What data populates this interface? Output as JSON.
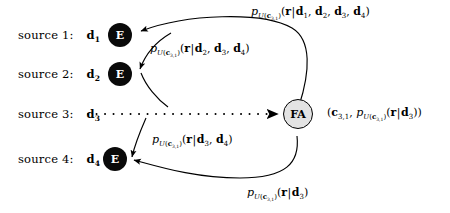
{
  "diagram": {
    "background_color": "#ffffff",
    "node_e_color": "#0a0a0a",
    "node_e_text_color": "#ffffff",
    "node_fa_color": "#e3e3e3",
    "node_fa_border_color": "#000000",
    "edge_color": "#000000"
  },
  "sources": [
    {
      "id": "source-1",
      "label": "source 1:",
      "variable": "d",
      "variable_sub": "1",
      "encoder_label": "E",
      "has_encoder": true,
      "connector": "solid"
    },
    {
      "id": "source-2",
      "label": "source 2:",
      "variable": "d",
      "variable_sub": "2",
      "encoder_label": "E",
      "has_encoder": true,
      "connector": "solid"
    },
    {
      "id": "source-3",
      "label": "source 3:",
      "variable": "d",
      "variable_sub": "3",
      "encoder_label": "",
      "has_encoder": false,
      "connector": "dotted"
    },
    {
      "id": "source-4",
      "label": "source 4:",
      "variable": "d",
      "variable_sub": "4",
      "encoder_label": "E",
      "has_encoder": true,
      "connector": "solid"
    }
  ],
  "aggregator": {
    "label": "FA",
    "name": "feedback-aggregator"
  },
  "formulas": {
    "top": {
      "p": "p",
      "sub_u": "U(",
      "sub_c": "c",
      "sub_c_index": "3,1",
      "sub_close": ")",
      "args_open": "(",
      "r": "r",
      "bar": "|",
      "conditions": [
        "d1",
        "d2",
        "d3",
        "d4"
      ],
      "conditions_text": "d1, d2, d3, d4",
      "args_close": ")",
      "full_text": "p_U(c_3,1)(r|d_1, d_2, d_3, d_4)"
    },
    "upper_mid": {
      "conditions_text": "d2, d3, d4",
      "full_text": "p_U(c_3,1)(r|d_2, d_3, d_4)"
    },
    "lower_mid": {
      "conditions_text": "d3, d4",
      "full_text": "p_U(c_3,1)(r|d_3, d_4)"
    },
    "bottom": {
      "conditions_text": "d3",
      "full_text": "p_U(c_3,1)(r|d_3)"
    },
    "output": {
      "open": "(",
      "c": "c",
      "c_index": "3,1",
      "comma": ", ",
      "close": ")",
      "full_text": "(c_3,1, p_U(c_3,1)(r|d_3))"
    }
  }
}
